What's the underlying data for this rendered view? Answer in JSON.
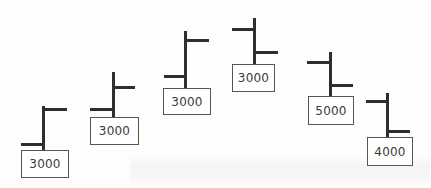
{
  "diagram": {
    "type": "hand-drawn tick glyphs with value boxes",
    "stroke_color": "#2e2e2e",
    "box_border_color": "#555555",
    "text_color": "#3a3a3a",
    "glyphs": [
      {
        "label": "3000",
        "stem": {
          "x": 43,
          "y1": 106,
          "y2": 150
        },
        "right_tick": {
          "y": 109,
          "x1": 43,
          "x2": 67
        },
        "left_tick": {
          "y": 144,
          "x1": 21,
          "x2": 44
        },
        "box": {
          "x": 21,
          "y": 150,
          "w": 48,
          "h": 28
        }
      },
      {
        "label": "3000",
        "stem": {
          "x": 113,
          "y1": 72,
          "y2": 117
        },
        "right_tick": {
          "y": 87,
          "x1": 113,
          "x2": 135
        },
        "left_tick": {
          "y": 109,
          "x1": 90,
          "x2": 114
        },
        "box": {
          "x": 90,
          "y": 117,
          "w": 49,
          "h": 28
        }
      },
      {
        "label": "3000",
        "stem": {
          "x": 185,
          "y1": 31,
          "y2": 88
        },
        "right_tick": {
          "y": 40,
          "x1": 185,
          "x2": 209
        },
        "left_tick": {
          "y": 76,
          "x1": 164,
          "x2": 186
        },
        "box": {
          "x": 163,
          "y": 88,
          "w": 48,
          "h": 27
        }
      },
      {
        "label": "3000",
        "stem": {
          "x": 254,
          "y1": 18,
          "y2": 64
        },
        "left_tick": {
          "y": 29,
          "x1": 232,
          "x2": 255
        },
        "right_tick": {
          "y": 52,
          "x1": 254,
          "x2": 278
        },
        "box": {
          "x": 232,
          "y": 64,
          "w": 43,
          "h": 28
        }
      },
      {
        "label": "5000",
        "stem": {
          "x": 330,
          "y1": 52,
          "y2": 96
        },
        "left_tick": {
          "y": 62,
          "x1": 307,
          "x2": 331
        },
        "right_tick": {
          "y": 85,
          "x1": 330,
          "x2": 353
        },
        "box": {
          "x": 308,
          "y": 96,
          "w": 46,
          "h": 29
        }
      },
      {
        "label": "4000",
        "stem": {
          "x": 387,
          "y1": 93,
          "y2": 137
        },
        "left_tick": {
          "y": 101,
          "x1": 366,
          "x2": 388
        },
        "right_tick": {
          "y": 131,
          "x1": 387,
          "x2": 410
        },
        "box": {
          "x": 367,
          "y": 137,
          "w": 46,
          "h": 29
        }
      }
    ]
  }
}
